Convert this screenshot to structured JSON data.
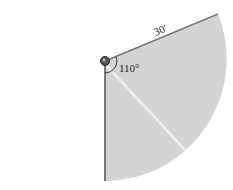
{
  "diagram": {
    "radius_label": "30′",
    "angle_label": "110°",
    "radius_value_ft": 30,
    "angle_deg": 110,
    "colors": {
      "sector_fill": "#d4d4d4",
      "edge": "#707070",
      "highlight": "#e8e8e8",
      "pivot": "#444444"
    }
  }
}
